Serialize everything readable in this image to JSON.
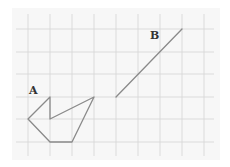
{
  "diagram": {
    "background": "#f7f7f7",
    "grid_color": "#d4d4d4",
    "shape_color": "#8a8a8a",
    "grid": {
      "x_lines": [
        28,
        50,
        72,
        94,
        116,
        138,
        160,
        182,
        204
      ],
      "y_lines": [
        29,
        52,
        74,
        97,
        119,
        142
      ]
    },
    "shape_a": {
      "label": "A",
      "points": [
        [
          28,
          119
        ],
        [
          50,
          97
        ],
        [
          50,
          119
        ],
        [
          94,
          97
        ],
        [
          72,
          142
        ],
        [
          50,
          142
        ]
      ]
    },
    "segment_b": {
      "label": "B",
      "from": [
        116,
        97
      ],
      "to": [
        182,
        29
      ]
    }
  }
}
